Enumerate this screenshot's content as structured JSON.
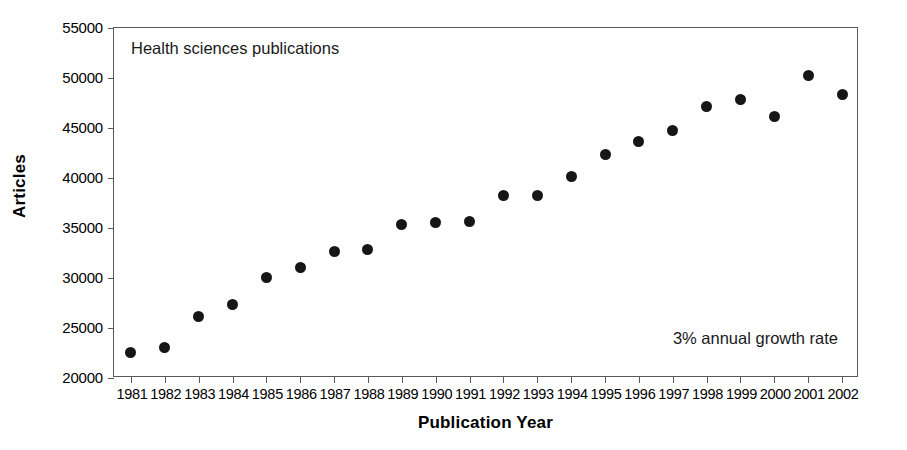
{
  "chart_data": {
    "type": "scatter",
    "title": "",
    "xlabel": "Publication Year",
    "ylabel": "Articles",
    "xlim": [
      1980.5,
      2002.5
    ],
    "ylim": [
      20000,
      55000
    ],
    "ytick_labels": [
      "55000",
      "50000",
      "45000",
      "40000",
      "35000",
      "30000",
      "25000",
      "20000"
    ],
    "ytick_values": [
      55000,
      50000,
      45000,
      40000,
      35000,
      30000,
      25000,
      20000
    ],
    "grid": false,
    "legend": null,
    "annotations": [
      {
        "name": "plot-title-note",
        "text": "Health sciences publications",
        "position": "top-left"
      },
      {
        "name": "growth-rate-note",
        "text": "3% annual growth rate",
        "position": "bottom-right"
      }
    ],
    "categories": [
      "1981",
      "1982",
      "1983",
      "1984",
      "1985",
      "1986",
      "1987",
      "1988",
      "1989",
      "1990",
      "1991",
      "1992",
      "1993",
      "1994",
      "1995",
      "1996",
      "1997",
      "1998",
      "1999",
      "2000",
      "2001",
      "2002"
    ],
    "x": [
      1981,
      1982,
      1983,
      1984,
      1985,
      1986,
      1987,
      1988,
      1989,
      1990,
      1991,
      1992,
      1993,
      1994,
      1995,
      1996,
      1997,
      1998,
      1999,
      2000,
      2001,
      2002
    ],
    "values": [
      22600,
      23100,
      26200,
      27400,
      30100,
      31100,
      32700,
      32900,
      35400,
      35600,
      35700,
      38300,
      38300,
      40200,
      42400,
      43700,
      44800,
      47200,
      47900,
      46200,
      50300,
      48400
    ],
    "series": [
      {
        "name": "Health sciences publications",
        "marker": "filled-circle",
        "color": "#161616",
        "values": [
          22600,
          23100,
          26200,
          27400,
          30100,
          31100,
          32700,
          32900,
          35400,
          35600,
          35700,
          38300,
          38300,
          40200,
          42400,
          43700,
          44800,
          47200,
          47900,
          46200,
          50300,
          48400
        ]
      }
    ]
  },
  "colors": {
    "marker": "#161616",
    "axis": "#5a5a5a",
    "background": "#ffffff",
    "text": "#000000"
  }
}
